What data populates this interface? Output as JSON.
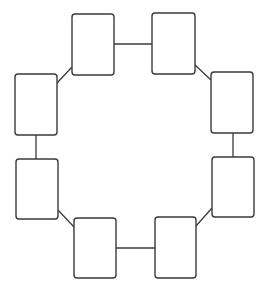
{
  "diagram": {
    "type": "ring-of-nodes",
    "canvas": {
      "width": 268,
      "height": 296,
      "background": "#ffffff"
    },
    "colors": {
      "stroke": "#3a3a3a",
      "fill": "#ffffff"
    },
    "node_corner_radius": 3,
    "nodes": [
      {
        "id": "n1",
        "position": "top-left",
        "x": 72,
        "y": 14,
        "w": 42,
        "h": 61,
        "label": ""
      },
      {
        "id": "n2",
        "position": "top-right",
        "x": 152,
        "y": 13,
        "w": 43,
        "h": 61,
        "label": ""
      },
      {
        "id": "n3",
        "position": "right-upper",
        "x": 211,
        "y": 72,
        "w": 42,
        "h": 61,
        "label": ""
      },
      {
        "id": "n4",
        "position": "right-lower",
        "x": 212,
        "y": 157,
        "w": 42,
        "h": 60,
        "label": ""
      },
      {
        "id": "n5",
        "position": "bottom-right",
        "x": 155,
        "y": 217,
        "w": 41,
        "h": 61,
        "label": ""
      },
      {
        "id": "n6",
        "position": "bottom-left",
        "x": 74,
        "y": 218,
        "w": 42,
        "h": 60,
        "label": ""
      },
      {
        "id": "n7",
        "position": "left-lower",
        "x": 16,
        "y": 159,
        "w": 42,
        "h": 60,
        "label": ""
      },
      {
        "id": "n8",
        "position": "left-upper",
        "x": 15,
        "y": 74,
        "w": 42,
        "h": 61,
        "label": ""
      }
    ],
    "edges": [
      {
        "from": "n1",
        "to": "n2",
        "x1": 114,
        "y1": 44,
        "x2": 152,
        "y2": 44
      },
      {
        "from": "n2",
        "to": "n3",
        "x1": 195,
        "y1": 65,
        "x2": 211,
        "y2": 80
      },
      {
        "from": "n3",
        "to": "n4",
        "x1": 233,
        "y1": 133,
        "x2": 233,
        "y2": 157
      },
      {
        "from": "n4",
        "to": "n5",
        "x1": 212,
        "y1": 208,
        "x2": 196,
        "y2": 226
      },
      {
        "from": "n5",
        "to": "n6",
        "x1": 155,
        "y1": 248,
        "x2": 116,
        "y2": 248
      },
      {
        "from": "n6",
        "to": "n7",
        "x1": 74,
        "y1": 227,
        "x2": 58,
        "y2": 210
      },
      {
        "from": "n7",
        "to": "n8",
        "x1": 36,
        "y1": 159,
        "x2": 36,
        "y2": 135
      },
      {
        "from": "n8",
        "to": "n1",
        "x1": 57,
        "y1": 83,
        "x2": 72,
        "y2": 67
      }
    ]
  }
}
